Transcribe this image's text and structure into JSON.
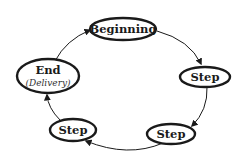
{
  "diagram": {
    "type": "cycle",
    "direction": "clockwise",
    "nodes": [
      {
        "id": "beginning",
        "label": "Beginning",
        "sublabel": ""
      },
      {
        "id": "step1",
        "label": "Step",
        "sublabel": ""
      },
      {
        "id": "step2",
        "label": "Step",
        "sublabel": ""
      },
      {
        "id": "step3",
        "label": "Step",
        "sublabel": ""
      },
      {
        "id": "end",
        "label": "End",
        "sublabel": "(Delivery)"
      }
    ],
    "edges": [
      {
        "from": "beginning",
        "to": "step1"
      },
      {
        "from": "step1",
        "to": "step2"
      },
      {
        "from": "step2",
        "to": "step3"
      },
      {
        "from": "step3",
        "to": "end"
      },
      {
        "from": "end",
        "to": "beginning"
      }
    ],
    "colors": {
      "stroke": "#1a1a1a",
      "fill": "#ffffff",
      "background": "#ffffff"
    }
  }
}
